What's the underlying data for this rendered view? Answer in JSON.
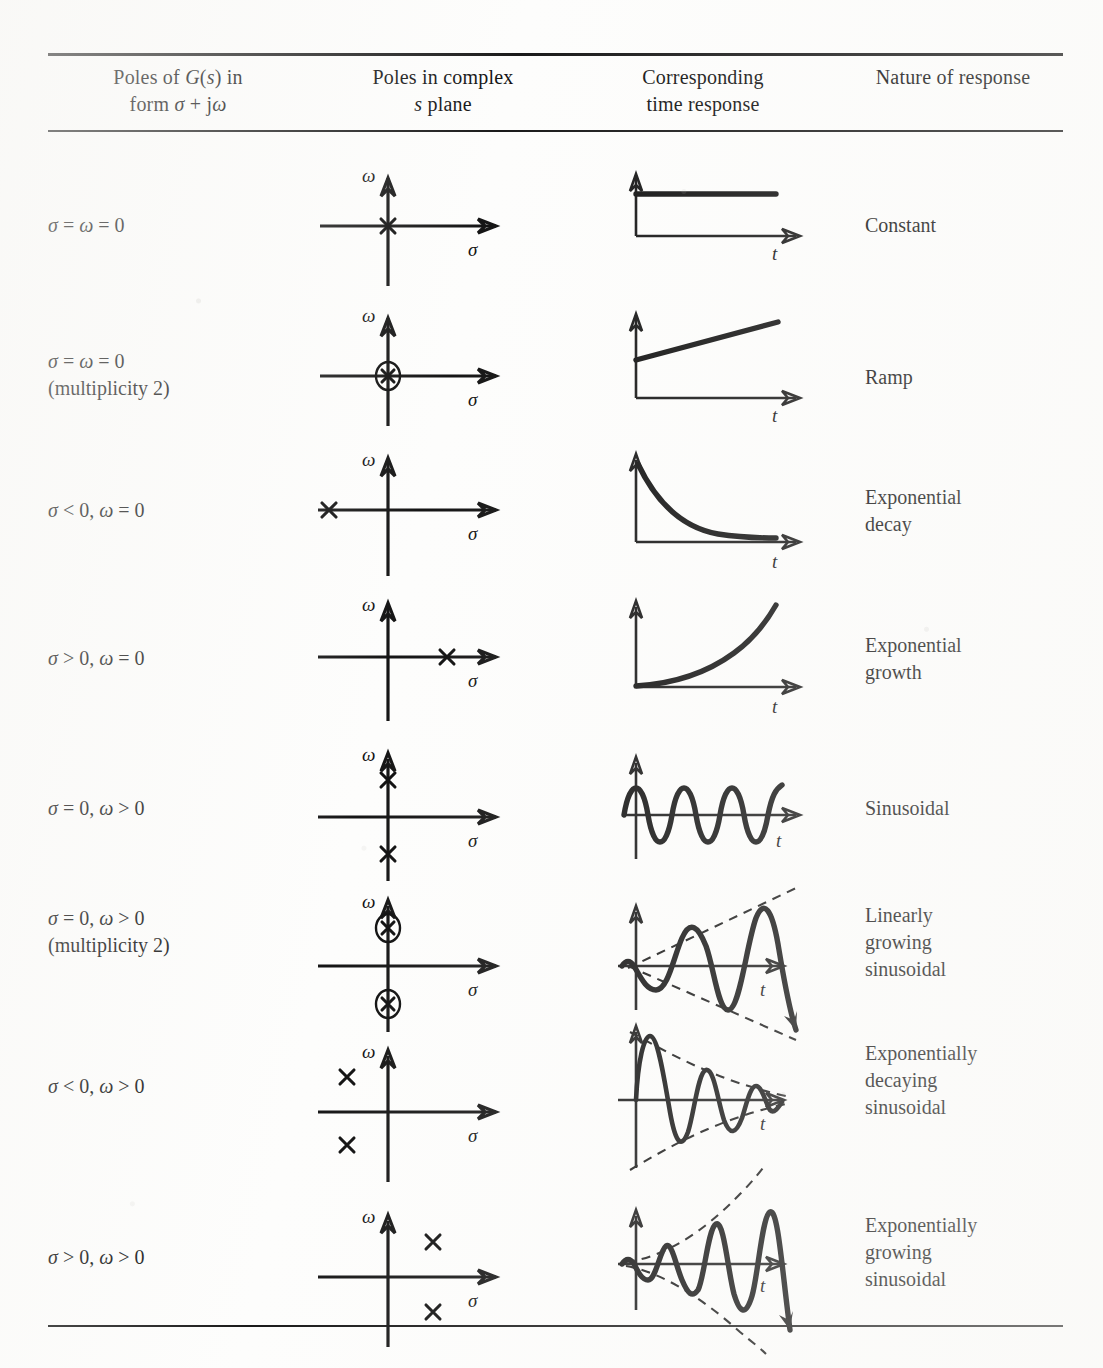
{
  "table": {
    "headers": [
      {
        "line1": "Poles of G(s) in",
        "line2": "form σ + jω"
      },
      {
        "line1": "Poles in complex",
        "line2": "s plane"
      },
      {
        "line1": "Corresponding",
        "line2": "time response"
      },
      {
        "line1": "Nature of response",
        "line2": ""
      }
    ],
    "rows": [
      {
        "condition": "σ = ω = 0",
        "condition_note": "",
        "nature": "Constant",
        "plane_axis_labels": {
          "vertical": "ω",
          "horizontal": "σ"
        },
        "time_axis_label": "t",
        "pole_kind": "x",
        "pole_positions": [
          {
            "sigma": 0,
            "omega": 0
          }
        ],
        "response_kind": "step-constant"
      },
      {
        "condition": "σ = ω = 0",
        "condition_note": "(multiplicity 2)",
        "nature": "Ramp",
        "plane_axis_labels": {
          "vertical": "ω",
          "horizontal": "σ"
        },
        "time_axis_label": "t",
        "pole_kind": "circled-x",
        "pole_positions": [
          {
            "sigma": 0,
            "omega": 0
          }
        ],
        "response_kind": "ramp"
      },
      {
        "condition": "σ < 0, ω = 0",
        "condition_note": "",
        "nature": "Exponential\ndecay",
        "plane_axis_labels": {
          "vertical": "ω",
          "horizontal": "σ"
        },
        "time_axis_label": "t",
        "pole_kind": "x",
        "pole_positions": [
          {
            "sigma": -1,
            "omega": 0
          }
        ],
        "response_kind": "exp-decay"
      },
      {
        "condition": "σ > 0, ω = 0",
        "condition_note": "",
        "nature": "Exponential\ngrowth",
        "plane_axis_labels": {
          "vertical": "ω",
          "horizontal": "σ"
        },
        "time_axis_label": "t",
        "pole_kind": "x",
        "pole_positions": [
          {
            "sigma": 1,
            "omega": 0
          }
        ],
        "response_kind": "exp-growth"
      },
      {
        "condition": "σ = 0, ω > 0",
        "condition_note": "",
        "nature": "Sinusoidal",
        "plane_axis_labels": {
          "vertical": "ω",
          "horizontal": "σ"
        },
        "time_axis_label": "t",
        "pole_kind": "x",
        "pole_positions": [
          {
            "sigma": 0,
            "omega": 1
          },
          {
            "sigma": 0,
            "omega": -1
          }
        ],
        "response_kind": "sinusoid"
      },
      {
        "condition": "σ = 0, ω > 0",
        "condition_note": "(multiplicity 2)",
        "nature": "Linearly\ngrowing\nsinusoidal",
        "plane_axis_labels": {
          "vertical": "ω",
          "horizontal": "σ"
        },
        "time_axis_label": "t",
        "pole_kind": "circled-x",
        "pole_positions": [
          {
            "sigma": 0,
            "omega": 1
          },
          {
            "sigma": 0,
            "omega": -1
          }
        ],
        "response_kind": "linear-growing-sinusoid",
        "envelope": "linear"
      },
      {
        "condition": "σ < 0, ω > 0",
        "condition_note": "",
        "nature": "Exponentially\ndecaying\nsinusoidal",
        "plane_axis_labels": {
          "vertical": "ω",
          "horizontal": "σ"
        },
        "time_axis_label": "t",
        "pole_kind": "x",
        "pole_positions": [
          {
            "sigma": -1,
            "omega": 1
          },
          {
            "sigma": -1,
            "omega": -1
          }
        ],
        "response_kind": "decaying-sinusoid",
        "envelope": "exponential-decay"
      },
      {
        "condition": "σ > 0, ω > 0",
        "condition_note": "",
        "nature": "Exponentially\ngrowing\nsinusoidal",
        "plane_axis_labels": {
          "vertical": "ω",
          "horizontal": "σ"
        },
        "time_axis_label": "t",
        "pole_kind": "x",
        "pole_positions": [
          {
            "sigma": 1,
            "omega": 1
          },
          {
            "sigma": 1,
            "omega": -1
          }
        ],
        "response_kind": "growing-sinusoid",
        "envelope": "exponential-growth"
      }
    ]
  }
}
